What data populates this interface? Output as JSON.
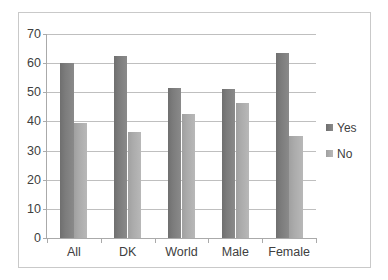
{
  "chart_data": {
    "type": "bar",
    "title": "",
    "subtitle": "",
    "xlabel": "",
    "ylabel": "",
    "categories": [
      "All",
      "DK",
      "World",
      "Male",
      "Female"
    ],
    "series": [
      {
        "name": "Yes",
        "color": "#7c7c7c",
        "values": [
          60,
          62.3,
          51.5,
          51,
          63.5
        ]
      },
      {
        "name": "No",
        "color": "#ababab",
        "values": [
          39.5,
          36.5,
          42.5,
          46.5,
          35
        ]
      }
    ],
    "ylim": [
      0,
      70
    ],
    "ytick_values": [
      0,
      10,
      20,
      30,
      40,
      50,
      60,
      70
    ],
    "ytick_labels": [
      "0",
      "10",
      "20",
      "30",
      "40",
      "50",
      "60",
      "70"
    ],
    "grid": true,
    "grid_axis": "y",
    "legend": true,
    "legend_position": "right",
    "border": true,
    "border_color": "#c9c9c9",
    "plot_background": "#ffffff"
  }
}
